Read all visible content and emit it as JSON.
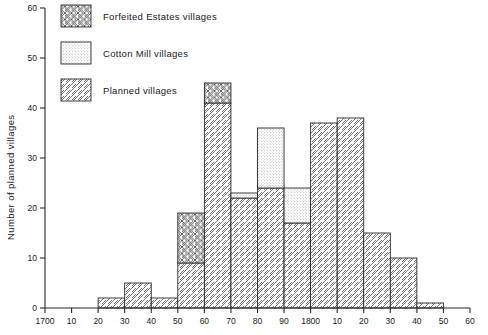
{
  "chart_data": {
    "type": "bar",
    "title": "",
    "subtitle": "",
    "xlabel": "",
    "ylabel": "Number of planned villages",
    "xlim": [
      1700,
      1860
    ],
    "ylim": [
      0,
      60
    ],
    "ytick_step": 10,
    "grid": false,
    "legend_position": "top-left-inside",
    "stacked": true,
    "bin_width": 10,
    "note": "Histogram of planned villages by decade of foundation, stacked by village category.",
    "categories": [
      "1700",
      "1710",
      "1720",
      "1730",
      "1740",
      "1750",
      "1760",
      "1770",
      "1780",
      "1790",
      "1800",
      "1810",
      "1820",
      "1830",
      "1840",
      "1850"
    ],
    "xtick_labels": [
      "1700",
      "10",
      "20",
      "30",
      "40",
      "50",
      "60",
      "70",
      "80",
      "90",
      "1800",
      "10",
      "20",
      "30",
      "40",
      "50",
      "60"
    ],
    "xtick_values": [
      1700,
      1710,
      1720,
      1730,
      1740,
      1750,
      1760,
      1770,
      1780,
      1790,
      1800,
      1810,
      1820,
      1830,
      1840,
      1850,
      1860
    ],
    "ytick_labels": [
      "0",
      "10",
      "20",
      "30",
      "40",
      "50",
      "60"
    ],
    "ytick_values": [
      0,
      10,
      20,
      30,
      40,
      50,
      60
    ],
    "series": [
      {
        "name": "Planned villages",
        "pattern": "diagonal-hatch",
        "values": [
          0,
          0,
          2,
          5,
          2,
          9,
          41,
          22,
          24,
          17,
          37,
          38,
          15,
          10,
          1,
          0
        ]
      },
      {
        "name": "Cotton Mill villages",
        "pattern": "dotted-stipple",
        "values": [
          0,
          0,
          0,
          0,
          0,
          0,
          0,
          1,
          12,
          7,
          0,
          0,
          0,
          0,
          0,
          0
        ]
      },
      {
        "name": "Forfeited Estates villages",
        "pattern": "cross-hatch",
        "values": [
          0,
          0,
          0,
          0,
          0,
          10,
          4,
          0,
          0,
          0,
          0,
          0,
          0,
          0,
          0,
          0
        ]
      }
    ],
    "totals": [
      0,
      0,
      2,
      5,
      2,
      19,
      45,
      23,
      36,
      24,
      37,
      38,
      15,
      10,
      1,
      0
    ]
  },
  "legend": {
    "items": [
      {
        "label": "Forfeited  Estates villages",
        "pattern": "cross-hatch"
      },
      {
        "label": "Cotton  Mill villages",
        "pattern": "dotted-stipple"
      },
      {
        "label": "Planned villages",
        "pattern": "diagonal-hatch"
      }
    ]
  }
}
